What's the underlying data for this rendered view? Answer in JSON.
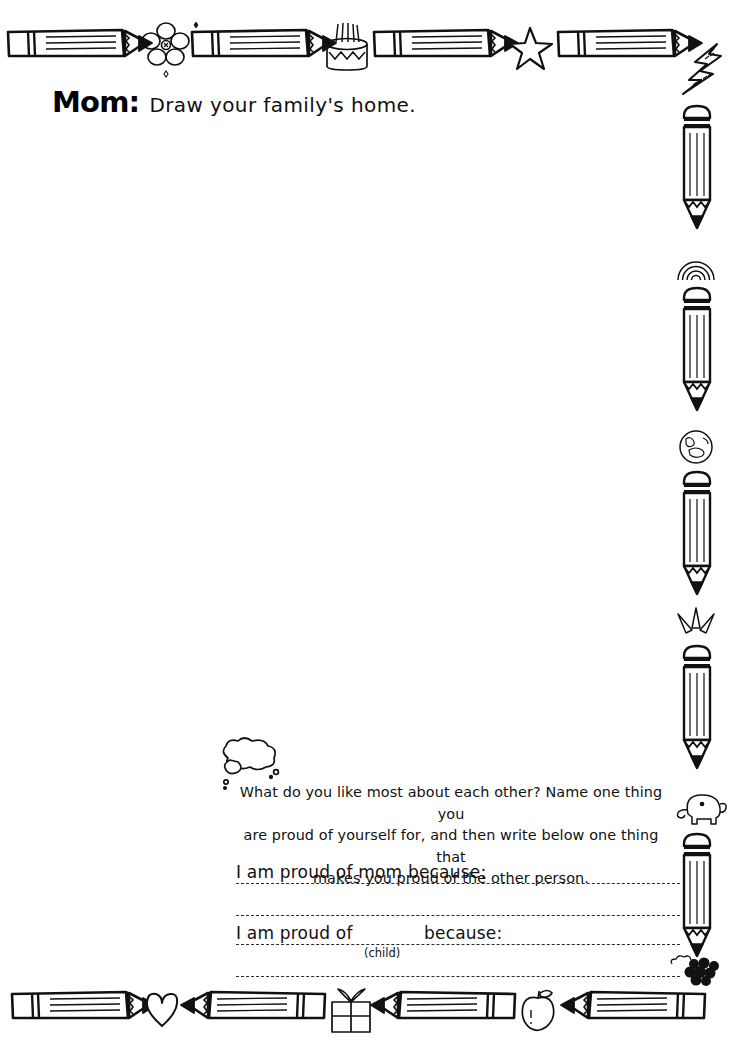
{
  "page": {
    "background": "#ffffff",
    "ink": "#111111",
    "width": 750,
    "height": 1056
  },
  "title": {
    "label": "Mom:",
    "prompt": "Draw your family's home."
  },
  "drawing_area": {
    "name": "blank drawing space"
  },
  "prompt": {
    "line1": "What do you like most about each other? Name one thing you",
    "line2": "are proud of yourself for, and then write below one thing that",
    "line3": "makes you proud of the other person."
  },
  "fields": [
    {
      "label": "I am proud of mom because:",
      "value": ""
    },
    {
      "label": "",
      "value": ""
    },
    {
      "label_a": "I am proud of",
      "hint": "(child)",
      "label_b": "because:",
      "value": ""
    },
    {
      "label": "",
      "value": ""
    }
  ],
  "field_labels": {
    "proud_of_mom": "I am proud of mom because:",
    "proud_of_a": "I am proud of",
    "proud_of_b": "because:",
    "child_hint": "(child)"
  },
  "borders": {
    "top_icons": [
      "pencil-icon",
      "flower-icon",
      "pencil-icon",
      "cake-icon",
      "pencil-icon",
      "star-icon",
      "pencil-icon",
      "lightning-bolt-icon"
    ],
    "right_icons": [
      "pencil-icon",
      "rainbow-icon",
      "pencil-icon",
      "globe-icon",
      "pencil-icon",
      "sparkle-icon",
      "pencil-icon",
      "elephant-icon",
      "pencil-icon",
      "berries-icon"
    ],
    "bottom_icons": [
      "pencil-icon",
      "heart-icon",
      "pencil-icon",
      "gift-icon",
      "pencil-icon",
      "apple-icon",
      "pencil-icon"
    ]
  }
}
